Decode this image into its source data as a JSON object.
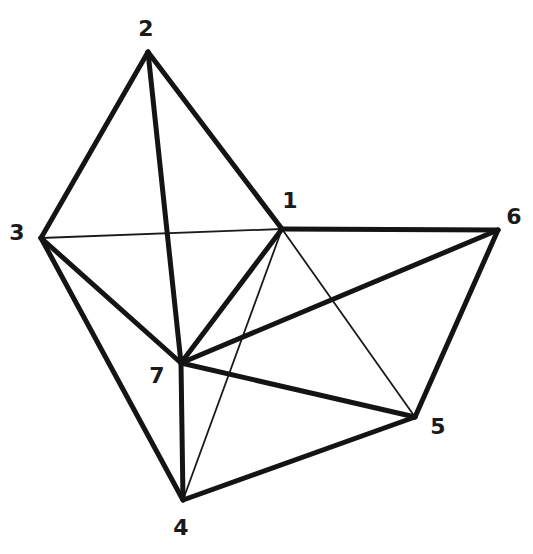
{
  "diagram": {
    "type": "graph",
    "directed": false,
    "colors": {
      "line": "#141414",
      "background": "#ffffff"
    },
    "nodes": [
      {
        "id": "1",
        "label": "1",
        "x": 282,
        "y": 229,
        "label_x": 290,
        "label_y": 202
      },
      {
        "id": "2",
        "label": "2",
        "x": 148,
        "y": 52,
        "label_x": 146,
        "label_y": 30
      },
      {
        "id": "3",
        "label": "3",
        "x": 41,
        "y": 238,
        "label_x": 17,
        "label_y": 234
      },
      {
        "id": "4",
        "label": "4",
        "x": 183,
        "y": 500,
        "label_x": 181,
        "label_y": 529
      },
      {
        "id": "5",
        "label": "5",
        "x": 415,
        "y": 417,
        "label_x": 438,
        "label_y": 428
      },
      {
        "id": "6",
        "label": "6",
        "x": 498,
        "y": 230,
        "label_x": 514,
        "label_y": 218
      },
      {
        "id": "7",
        "label": "7",
        "x": 181,
        "y": 363,
        "label_x": 157,
        "label_y": 377
      }
    ],
    "edges": [
      {
        "from": "2",
        "to": "3",
        "weight": "thick"
      },
      {
        "from": "2",
        "to": "1",
        "weight": "thick"
      },
      {
        "from": "2",
        "to": "7",
        "weight": "thick"
      },
      {
        "from": "3",
        "to": "7",
        "weight": "thick"
      },
      {
        "from": "3",
        "to": "4",
        "weight": "thick"
      },
      {
        "from": "1",
        "to": "7",
        "weight": "thick"
      },
      {
        "from": "1",
        "to": "6",
        "weight": "thick"
      },
      {
        "from": "7",
        "to": "6",
        "weight": "thick"
      },
      {
        "from": "7",
        "to": "4",
        "weight": "thick"
      },
      {
        "from": "7",
        "to": "5",
        "weight": "thick"
      },
      {
        "from": "6",
        "to": "5",
        "weight": "thick"
      },
      {
        "from": "4",
        "to": "5",
        "weight": "thick"
      },
      {
        "from": "3",
        "to": "1",
        "weight": "thin"
      },
      {
        "from": "1",
        "to": "5",
        "weight": "thin"
      },
      {
        "from": "1",
        "to": "4",
        "weight": "thin"
      }
    ]
  }
}
